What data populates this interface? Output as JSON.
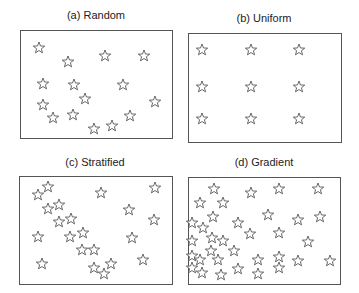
{
  "panels": [
    {
      "id": "a",
      "title": "(a) Random",
      "title_pos": [
        96,
        10
      ],
      "box": [
        20,
        30,
        152,
        108
      ],
      "stars": [
        [
          39,
          48
        ],
        [
          68,
          62
        ],
        [
          105,
          56
        ],
        [
          144,
          56
        ],
        [
          43,
          84
        ],
        [
          74,
          85
        ],
        [
          123,
          85
        ],
        [
          85,
          99
        ],
        [
          155,
          102
        ],
        [
          43,
          105
        ],
        [
          53,
          118
        ],
        [
          73,
          115
        ],
        [
          130,
          116
        ],
        [
          94,
          129
        ],
        [
          112,
          126
        ]
      ]
    },
    {
      "id": "b",
      "title": "(b) Uniform",
      "title_pos": [
        264,
        13
      ],
      "box": [
        188,
        33,
        153,
        109
      ],
      "stars": [
        [
          202,
          50
        ],
        [
          251,
          50
        ],
        [
          299,
          50
        ],
        [
          202,
          87
        ],
        [
          251,
          87
        ],
        [
          299,
          87
        ],
        [
          202,
          119
        ],
        [
          251,
          119
        ],
        [
          299,
          119
        ]
      ]
    },
    {
      "id": "c",
      "title": "(c) Stratified",
      "title_pos": [
        95,
        157
      ],
      "box": [
        19,
        176,
        153,
        108
      ],
      "stars": [
        [
          38,
          195
        ],
        [
          48,
          187
        ],
        [
          101,
          193
        ],
        [
          155,
          188
        ],
        [
          48,
          209
        ],
        [
          59,
          205
        ],
        [
          129,
          210
        ],
        [
          59,
          222
        ],
        [
          71,
          219
        ],
        [
          154,
          220
        ],
        [
          38,
          237
        ],
        [
          70,
          237
        ],
        [
          83,
          233
        ],
        [
          132,
          238
        ],
        [
          82,
          250
        ],
        [
          94,
          250
        ],
        [
          42,
          264
        ],
        [
          94,
          268
        ],
        [
          111,
          264
        ],
        [
          104,
          274
        ],
        [
          143,
          260
        ]
      ]
    },
    {
      "id": "d",
      "title": "(d) Gradient",
      "title_pos": [
        264,
        157
      ],
      "box": [
        188,
        177,
        152,
        107
      ],
      "stars": [
        [
          214,
          189
        ],
        [
          251,
          193
        ],
        [
          279,
          189
        ],
        [
          318,
          189
        ],
        [
          200,
          203
        ],
        [
          223,
          203
        ],
        [
          213,
          217
        ],
        [
          268,
          215
        ],
        [
          298,
          220
        ],
        [
          320,
          217
        ],
        [
          192,
          223
        ],
        [
          203,
          228
        ],
        [
          238,
          223
        ],
        [
          250,
          234
        ],
        [
          279,
          233
        ],
        [
          192,
          241
        ],
        [
          212,
          238
        ],
        [
          223,
          241
        ],
        [
          308,
          242
        ],
        [
          211,
          251
        ],
        [
          234,
          251
        ],
        [
          192,
          256
        ],
        [
          200,
          260
        ],
        [
          218,
          260
        ],
        [
          258,
          260
        ],
        [
          279,
          257
        ],
        [
          298,
          261
        ],
        [
          330,
          261
        ],
        [
          192,
          268
        ],
        [
          202,
          273
        ],
        [
          221,
          275
        ],
        [
          238,
          269
        ],
        [
          258,
          274
        ],
        [
          279,
          268
        ]
      ]
    }
  ],
  "style": {
    "stroke": "#444444",
    "box_stroke": "#555555",
    "star_radius": 6
  }
}
